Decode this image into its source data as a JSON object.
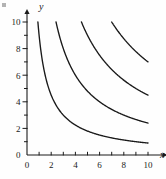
{
  "figure": {
    "corner_mark": "crop-artifact",
    "background_color": "#fefefe",
    "curve_color": "#1a1a1a",
    "axis_color": "#1a1a1a"
  },
  "axis_labels": {
    "y": "y",
    "x": "x"
  },
  "chart_data": {
    "type": "line",
    "title": "",
    "subtitle": "",
    "xlabel": "x",
    "ylabel": "y",
    "xlim": [
      0,
      11.2
    ],
    "ylim": [
      0,
      10.6
    ],
    "grid": false,
    "legend": "none",
    "x_ticks": [
      0,
      1,
      2,
      3,
      4,
      5,
      6,
      7,
      8,
      9,
      10
    ],
    "x_tick_labels": [
      "0",
      "",
      "2",
      "",
      "4",
      "",
      "6",
      "",
      "8",
      "",
      "10"
    ],
    "y_ticks": [
      0,
      1,
      2,
      3,
      4,
      5,
      6,
      7,
      8,
      9,
      10
    ],
    "y_tick_labels": [
      "0",
      "",
      "2",
      "",
      "4",
      "",
      "6",
      "",
      "8",
      "",
      "10"
    ],
    "series": [
      {
        "name": "xy = 9",
        "k": 9,
        "x_start": 0.9,
        "x_end": 10.0,
        "y_at_x10": 0.9
      },
      {
        "name": "xy = 24",
        "k": 24,
        "x_start": 2.4,
        "x_end": 10.0,
        "y_at_x10": 2.4
      },
      {
        "name": "xy = 45",
        "k": 45,
        "x_start": 4.5,
        "x_end": 10.0,
        "y_at_x10": 4.5
      },
      {
        "name": "xy = 70",
        "k": 70,
        "x_start": 7.0,
        "x_end": 10.0,
        "y_at_x10": 7.0
      }
    ]
  }
}
